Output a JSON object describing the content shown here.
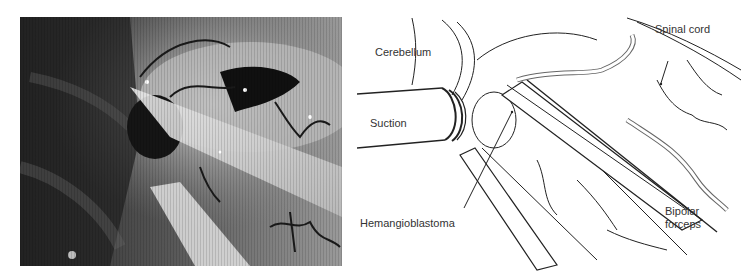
{
  "figure": {
    "left_panel": {
      "type": "intraoperative-photograph",
      "description": "grayscale microscope view"
    },
    "right_panel": {
      "type": "surgical-illustration",
      "labels": {
        "cerebellum": "Cerebellum",
        "spinal_cord": "Spinal cord",
        "suction": "Suction",
        "hemangioblastoma": "Hemangioblastoma",
        "bipolar_line1": "Bipolar",
        "bipolar_line2": "forceps"
      }
    }
  },
  "colors": {
    "background": "#ffffff",
    "label_text": "#333333",
    "line_art": "#222222"
  }
}
